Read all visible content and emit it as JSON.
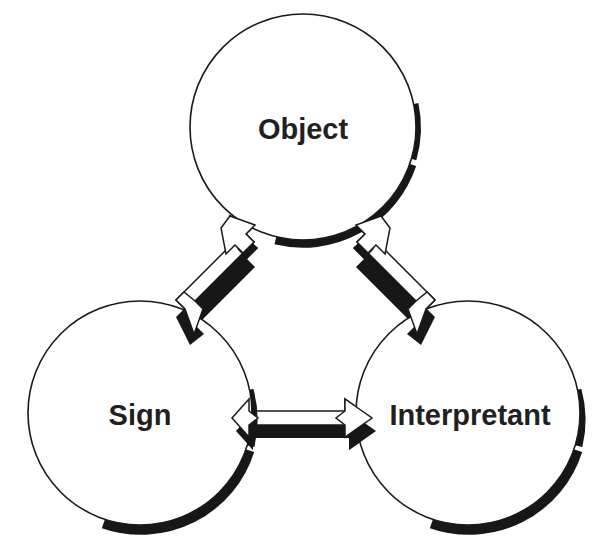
{
  "diagram": {
    "type": "triadic-relation-diagram",
    "background_color": "#ffffff",
    "outline_color": "#1a1a1a",
    "shadow_color": "#171717",
    "label_color": "#231f20",
    "nodes": [
      {
        "id": "object",
        "label": "Object",
        "position": "top",
        "cx": 303,
        "cy": 127,
        "r": 113,
        "font_size": 29
      },
      {
        "id": "sign",
        "label": "Sign",
        "position": "bottom-left",
        "cx": 140,
        "cy": 413,
        "r": 112,
        "font_size": 29
      },
      {
        "id": "interpretant",
        "label": "Interpretant",
        "position": "bottom-right",
        "cx": 468,
        "cy": 413,
        "r": 112,
        "font_size": 29
      }
    ],
    "connectors": [
      {
        "id": "sign-object",
        "from": "sign",
        "to": "object",
        "style": "double-headed-block-arrow",
        "orientation": "diagonal-up-right"
      },
      {
        "id": "object-interpretant",
        "from": "object",
        "to": "interpretant",
        "style": "double-headed-block-arrow",
        "orientation": "diagonal-down-right"
      },
      {
        "id": "sign-interpretant",
        "from": "sign",
        "to": "interpretant",
        "style": "double-headed-block-arrow",
        "orientation": "horizontal"
      }
    ]
  }
}
